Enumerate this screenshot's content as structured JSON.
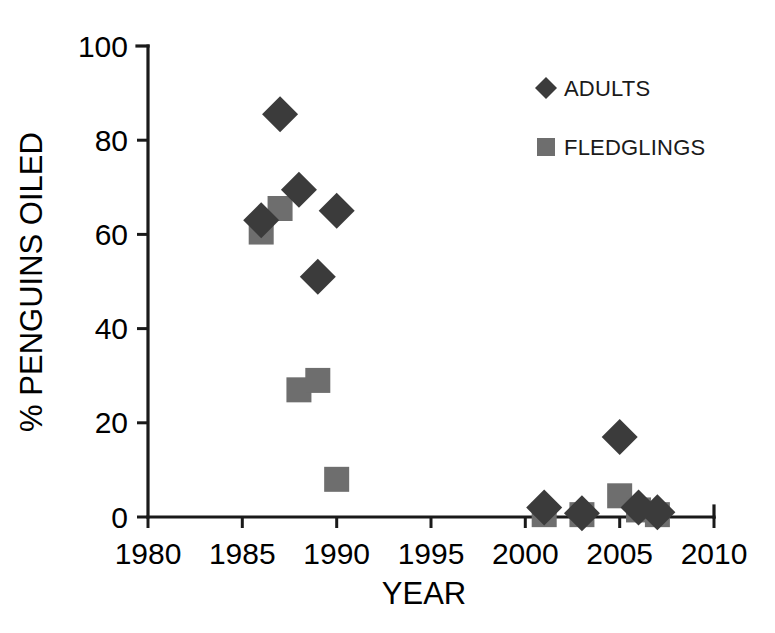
{
  "chart_data": {
    "type": "scatter",
    "title": "",
    "xlabel": "YEAR",
    "ylabel": "% PENGUINS OILED",
    "xlim": [
      1980,
      2010
    ],
    "ylim": [
      0,
      100
    ],
    "xticks": [
      1980,
      1985,
      1990,
      1995,
      2000,
      2005,
      2010
    ],
    "yticks": [
      0,
      20,
      40,
      60,
      80,
      100
    ],
    "grid": false,
    "legend_position": "top-right",
    "series": [
      {
        "name": "ADULTS",
        "marker": "diamond",
        "color": "#3b3b3b",
        "points": [
          {
            "x": 1986,
            "y": 63
          },
          {
            "x": 1987,
            "y": 85.5
          },
          {
            "x": 1988,
            "y": 69.5
          },
          {
            "x": 1989,
            "y": 51
          },
          {
            "x": 1990,
            "y": 65
          },
          {
            "x": 2001,
            "y": 2
          },
          {
            "x": 2003,
            "y": 0.8
          },
          {
            "x": 2005,
            "y": 17
          },
          {
            "x": 2006,
            "y": 2
          },
          {
            "x": 2007,
            "y": 1
          }
        ]
      },
      {
        "name": "FLEDGLINGS",
        "marker": "square",
        "color": "#6e6e6e",
        "points": [
          {
            "x": 1986,
            "y": 60.5
          },
          {
            "x": 1987,
            "y": 65.5
          },
          {
            "x": 1988,
            "y": 27
          },
          {
            "x": 1989,
            "y": 29
          },
          {
            "x": 1990,
            "y": 8
          },
          {
            "x": 2001,
            "y": 0.5
          },
          {
            "x": 2003,
            "y": 0.5
          },
          {
            "x": 2005,
            "y": 4.5
          },
          {
            "x": 2006,
            "y": 1.5
          },
          {
            "x": 2007,
            "y": 0.5
          }
        ]
      }
    ]
  },
  "axes": {
    "x_tick_labels": [
      "1980",
      "1985",
      "1990",
      "1995",
      "2000",
      "2005",
      "2010"
    ],
    "y_tick_labels": [
      "0",
      "20",
      "40",
      "60",
      "80",
      "100"
    ],
    "x_axis_title": "YEAR",
    "y_axis_title": "% PENGUINS OILED"
  },
  "legend": {
    "entries": [
      {
        "label": "ADULTS",
        "marker": "diamond",
        "color": "#3b3b3b"
      },
      {
        "label": "FLEDGLINGS",
        "marker": "square",
        "color": "#6e6e6e"
      }
    ]
  }
}
